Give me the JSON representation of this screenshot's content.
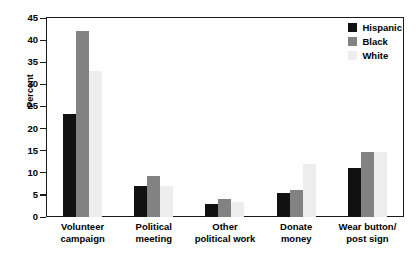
{
  "chart_data": {
    "type": "bar",
    "title": "",
    "xlabel": "",
    "ylabel": "Percent",
    "ylim": [
      0,
      45
    ],
    "yticks": [
      0,
      5,
      10,
      15,
      20,
      25,
      30,
      35,
      40,
      45
    ],
    "grid": false,
    "legend_position": "top-right",
    "categories": [
      "Volunteer\ncampaign",
      "Political\nmeeting",
      "Other\npolitical work",
      "Donate\nmoney",
      "Wear button/\npost sign"
    ],
    "series": [
      {
        "name": "Hispanic",
        "color": "#111111",
        "values": [
          23.4,
          7.0,
          3.0,
          5.5,
          11.0
        ]
      },
      {
        "name": "Black",
        "color": "#828282",
        "values": [
          42.0,
          9.2,
          4.0,
          6.2,
          14.7
        ]
      },
      {
        "name": "White",
        "color": "#ededed",
        "values": [
          33.0,
          7.0,
          3.5,
          12.0,
          14.7
        ]
      }
    ]
  },
  "legend": {
    "items": [
      {
        "label": "Hispanic",
        "swatch": "hispanic"
      },
      {
        "label": "Black",
        "swatch": "black"
      },
      {
        "label": "White",
        "swatch": "white"
      }
    ]
  }
}
